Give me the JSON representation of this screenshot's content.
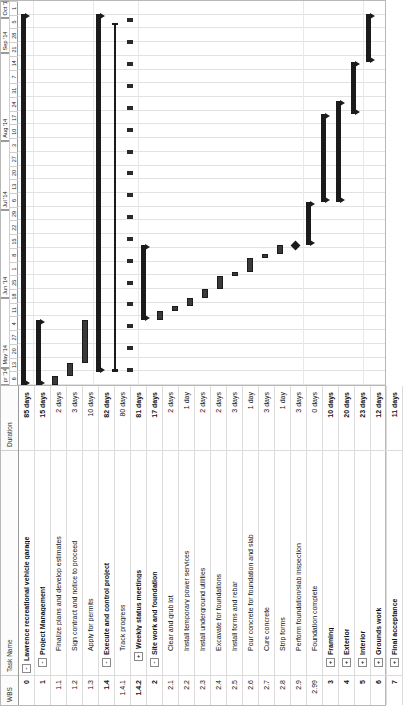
{
  "view": {
    "title": "Lawrence recreational vehicle garage",
    "orientation": "rotated-90-ccw"
  },
  "table": {
    "columns": {
      "wbs": "WBS",
      "task_name": "Task Name",
      "duration": "Duration"
    },
    "rows": [
      {
        "wbs": "0",
        "name": "Lawrence recreational vehicle garage",
        "duration": "85 days",
        "indent": 0,
        "toggle": "-",
        "summary": true,
        "bar": "summary",
        "start": 0,
        "end": 85
      },
      {
        "wbs": "1",
        "name": "Project Management",
        "duration": "15 days",
        "indent": 1,
        "toggle": "-",
        "summary": true,
        "bar": "summary",
        "start": 0,
        "end": 15
      },
      {
        "wbs": "1.1",
        "name": "Finalize plans and develop estimates",
        "duration": "2 days",
        "indent": 2,
        "toggle": "",
        "summary": false,
        "bar": "task",
        "start": 0,
        "end": 2
      },
      {
        "wbs": "1.2",
        "name": "Sign contract and notice to proceed",
        "duration": "3 days",
        "indent": 2,
        "toggle": "",
        "summary": false,
        "bar": "task",
        "start": 2,
        "end": 5
      },
      {
        "wbs": "1.3",
        "name": "Apply for permits",
        "duration": "10 days",
        "indent": 2,
        "toggle": "",
        "summary": false,
        "bar": "task",
        "start": 5,
        "end": 15
      },
      {
        "wbs": "1.4",
        "name": "Execute and control project",
        "duration": "82 days",
        "indent": 1,
        "toggle": "-",
        "summary": true,
        "bar": "summary",
        "start": 3,
        "end": 85
      },
      {
        "wbs": "1.4.1",
        "name": "Track progress",
        "duration": "80 days",
        "indent": 2,
        "toggle": "",
        "summary": false,
        "bar": "thinline",
        "start": 3,
        "end": 83
      },
      {
        "wbs": "1.4.2",
        "name": "Weekly status meetings",
        "duration": "81 days",
        "indent": 2,
        "toggle": "+",
        "summary": true,
        "bar": "ticks",
        "start": 3,
        "end": 84
      },
      {
        "wbs": "2",
        "name": "Site work and foundation",
        "duration": "17 days",
        "indent": 1,
        "toggle": "-",
        "summary": true,
        "bar": "summary",
        "start": 15,
        "end": 32
      },
      {
        "wbs": "2.1",
        "name": "Clear and grub lot",
        "duration": "2 days",
        "indent": 2,
        "toggle": "",
        "summary": false,
        "bar": "task",
        "start": 15,
        "end": 17
      },
      {
        "wbs": "2.2",
        "name": "Install temporary power services",
        "duration": "1 day",
        "indent": 2,
        "toggle": "",
        "summary": false,
        "bar": "task",
        "start": 17,
        "end": 18
      },
      {
        "wbs": "2.3",
        "name": "Install underground utilities",
        "duration": "2 days",
        "indent": 2,
        "toggle": "",
        "summary": false,
        "bar": "task",
        "start": 18,
        "end": 20
      },
      {
        "wbs": "2.4",
        "name": "Excavate for foundations",
        "duration": "2 days",
        "indent": 2,
        "toggle": "",
        "summary": false,
        "bar": "task",
        "start": 20,
        "end": 22
      },
      {
        "wbs": "2.5",
        "name": "Install forms and rebar",
        "duration": "3 days",
        "indent": 2,
        "toggle": "",
        "summary": false,
        "bar": "task",
        "start": 22,
        "end": 25
      },
      {
        "wbs": "2.6",
        "name": "Pour concrete for foundation and slab",
        "duration": "1 day",
        "indent": 2,
        "toggle": "",
        "summary": false,
        "bar": "task",
        "start": 25,
        "end": 26
      },
      {
        "wbs": "2.7",
        "name": "Cure concrete",
        "duration": "3 days",
        "indent": 2,
        "toggle": "",
        "summary": false,
        "bar": "task",
        "start": 26,
        "end": 29
      },
      {
        "wbs": "2.8",
        "name": "Strip forms",
        "duration": "1 day",
        "indent": 2,
        "toggle": "",
        "summary": false,
        "bar": "task",
        "start": 29,
        "end": 30
      },
      {
        "wbs": "2.9",
        "name": "Perform foundation/slab inspection",
        "duration": "3 days",
        "indent": 2,
        "toggle": "",
        "summary": false,
        "bar": "task",
        "start": 30,
        "end": 32
      },
      {
        "wbs": "2.99",
        "name": "Foundation complete",
        "duration": "0 days",
        "indent": 2,
        "toggle": "",
        "summary": false,
        "bar": "milestone",
        "start": 32,
        "end": 32
      },
      {
        "wbs": "3",
        "name": "Framing",
        "duration": "10 days",
        "indent": 1,
        "toggle": "+",
        "summary": true,
        "bar": "summary",
        "start": 32,
        "end": 42
      },
      {
        "wbs": "4",
        "name": "Exterior",
        "duration": "20 days",
        "indent": 1,
        "toggle": "+",
        "summary": true,
        "bar": "summary",
        "start": 42,
        "end": 62
      },
      {
        "wbs": "5",
        "name": "Interior",
        "duration": "23 days",
        "indent": 1,
        "toggle": "+",
        "summary": true,
        "bar": "summary",
        "start": 42,
        "end": 65
      },
      {
        "wbs": "6",
        "name": "Grounds work",
        "duration": "12 days",
        "indent": 1,
        "toggle": "+",
        "summary": true,
        "bar": "summary",
        "start": 62,
        "end": 74
      },
      {
        "wbs": "7",
        "name": "Final acceptance",
        "duration": "11 days",
        "indent": 1,
        "toggle": "+",
        "summary": true,
        "bar": "summary",
        "start": 74,
        "end": 85
      }
    ]
  },
  "timeline": {
    "total_units": 88,
    "months": [
      {
        "label": "pr '14",
        "start": 0,
        "span": 4
      },
      {
        "label": "May '14",
        "start": 4,
        "span": 16
      },
      {
        "label": "Jun '14",
        "start": 20,
        "span": 20
      },
      {
        "label": "Jul '14",
        "start": 40,
        "span": 16
      },
      {
        "label": "Aug '14",
        "start": 56,
        "span": 20
      },
      {
        "label": "Sep '14",
        "start": 76,
        "span": 8
      },
      {
        "label": "Oct '1:",
        "start": 84,
        "span": 4
      }
    ],
    "weeks": [
      {
        "label": "6",
        "start": 0
      },
      {
        "label": "13",
        "start": 4
      },
      {
        "label": "20",
        "start": 8
      },
      {
        "label": "27",
        "start": 12
      },
      {
        "label": "4",
        "start": 16
      },
      {
        "label": "11",
        "start": 20
      },
      {
        "label": "18",
        "start": 24
      },
      {
        "label": "25",
        "start": 28
      },
      {
        "label": "1",
        "start": 32
      },
      {
        "label": "8",
        "start": 36
      },
      {
        "label": "15",
        "start": 40
      },
      {
        "label": "22",
        "start": 44
      },
      {
        "label": "29",
        "start": 48
      },
      {
        "label": "6",
        "start": 52
      },
      {
        "label": "13",
        "start": 56
      },
      {
        "label": "20",
        "start": 60
      },
      {
        "label": "27",
        "start": 64
      },
      {
        "label": "3",
        "start": 68
      },
      {
        "label": "10",
        "start": 72
      },
      {
        "label": "17",
        "start": 76
      },
      {
        "label": "24",
        "start": 80
      },
      {
        "label": "31",
        "start": 84
      },
      {
        "label": "7",
        "start": 88
      },
      {
        "label": "14",
        "start": 92
      },
      {
        "label": "21",
        "start": 96
      },
      {
        "label": "28",
        "start": 100
      },
      {
        "label": "5",
        "start": 104
      },
      {
        "label": "1",
        "start": 108
      }
    ],
    "major_gridlines_at": [
      16,
      32,
      48,
      64,
      80,
      96
    ],
    "horizontal_gridlines_rows": [
      1,
      5,
      8,
      19,
      23
    ]
  },
  "chart_data": {
    "type": "gantt",
    "title": "Lawrence recreational vehicle garage",
    "xlabel": "Timeline (weeks, Apr '14 - Oct '14)",
    "ylabel": "Tasks (WBS)",
    "bar_colors": {
      "task": "#3a3a3a",
      "summary": "#1b1b1b",
      "milestone": "#1b1b1b"
    },
    "tasks": [
      {
        "wbs": "0",
        "name": "Lawrence recreational vehicle garage",
        "duration_days": 85,
        "type": "summary"
      },
      {
        "wbs": "1",
        "name": "Project Management",
        "duration_days": 15,
        "type": "summary"
      },
      {
        "wbs": "1.1",
        "name": "Finalize plans and develop estimates",
        "duration_days": 2,
        "type": "task"
      },
      {
        "wbs": "1.2",
        "name": "Sign contract and notice to proceed",
        "duration_days": 3,
        "type": "task"
      },
      {
        "wbs": "1.3",
        "name": "Apply for permits",
        "duration_days": 10,
        "type": "task"
      },
      {
        "wbs": "1.4",
        "name": "Execute and control project",
        "duration_days": 82,
        "type": "summary"
      },
      {
        "wbs": "1.4.1",
        "name": "Track progress",
        "duration_days": 80,
        "type": "task"
      },
      {
        "wbs": "1.4.2",
        "name": "Weekly status meetings",
        "duration_days": 81,
        "type": "recurring"
      },
      {
        "wbs": "2",
        "name": "Site work and foundation",
        "duration_days": 17,
        "type": "summary"
      },
      {
        "wbs": "2.1",
        "name": "Clear and grub lot",
        "duration_days": 2,
        "type": "task"
      },
      {
        "wbs": "2.2",
        "name": "Install temporary power services",
        "duration_days": 1,
        "type": "task"
      },
      {
        "wbs": "2.3",
        "name": "Install underground utilities",
        "duration_days": 2,
        "type": "task"
      },
      {
        "wbs": "2.4",
        "name": "Excavate for foundations",
        "duration_days": 2,
        "type": "task"
      },
      {
        "wbs": "2.5",
        "name": "Install forms and rebar",
        "duration_days": 3,
        "type": "task"
      },
      {
        "wbs": "2.6",
        "name": "Pour concrete for foundation and slab",
        "duration_days": 1,
        "type": "task"
      },
      {
        "wbs": "2.7",
        "name": "Cure concrete",
        "duration_days": 3,
        "type": "task"
      },
      {
        "wbs": "2.8",
        "name": "Strip forms",
        "duration_days": 1,
        "type": "task"
      },
      {
        "wbs": "2.9",
        "name": "Perform foundation/slab inspection",
        "duration_days": 3,
        "type": "task"
      },
      {
        "wbs": "2.99",
        "name": "Foundation complete",
        "duration_days": 0,
        "type": "milestone"
      },
      {
        "wbs": "3",
        "name": "Framing",
        "duration_days": 10,
        "type": "summary"
      },
      {
        "wbs": "4",
        "name": "Exterior",
        "duration_days": 20,
        "type": "summary"
      },
      {
        "wbs": "5",
        "name": "Interior",
        "duration_days": 23,
        "type": "summary"
      },
      {
        "wbs": "6",
        "name": "Grounds work",
        "duration_days": 12,
        "type": "summary"
      },
      {
        "wbs": "7",
        "name": "Final acceptance",
        "duration_days": 11,
        "type": "summary"
      }
    ]
  }
}
